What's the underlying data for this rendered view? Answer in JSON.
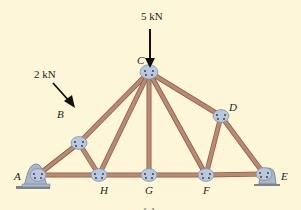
{
  "figure": {
    "caption": "(a)",
    "background_color": "#fdf6d8",
    "member_color": "#b98a72",
    "member_edge_color": "#8a5e4a",
    "gusset_color": "#b9c8de",
    "support_color": "#a9b7c9"
  },
  "loads": [
    {
      "label": "5 kN",
      "joint": "C",
      "direction": "down"
    },
    {
      "label": "2 kN",
      "joint": "B",
      "direction": "perpendicular to top chord"
    }
  ],
  "joints": [
    {
      "id": "A",
      "label": "A",
      "x": 38,
      "y": 175
    },
    {
      "id": "B",
      "label": "B",
      "x": 79,
      "y": 143
    },
    {
      "id": "C",
      "label": "C",
      "x": 149,
      "y": 72
    },
    {
      "id": "D",
      "label": "D",
      "x": 221,
      "y": 116
    },
    {
      "id": "E",
      "label": "E",
      "x": 264,
      "y": 174
    },
    {
      "id": "H",
      "label": "H",
      "x": 99,
      "y": 175
    },
    {
      "id": "G",
      "label": "G",
      "x": 149,
      "y": 175
    },
    {
      "id": "F",
      "label": "F",
      "x": 206,
      "y": 175
    }
  ],
  "members": [
    [
      "A",
      "B"
    ],
    [
      "B",
      "C"
    ],
    [
      "C",
      "D"
    ],
    [
      "D",
      "E"
    ],
    [
      "A",
      "H"
    ],
    [
      "H",
      "G"
    ],
    [
      "G",
      "F"
    ],
    [
      "F",
      "E"
    ],
    [
      "B",
      "H"
    ],
    [
      "H",
      "C"
    ],
    [
      "C",
      "G"
    ],
    [
      "C",
      "F"
    ],
    [
      "F",
      "D"
    ]
  ],
  "supports": [
    {
      "joint": "A",
      "type": "pin"
    },
    {
      "joint": "E",
      "type": "roller"
    }
  ]
}
